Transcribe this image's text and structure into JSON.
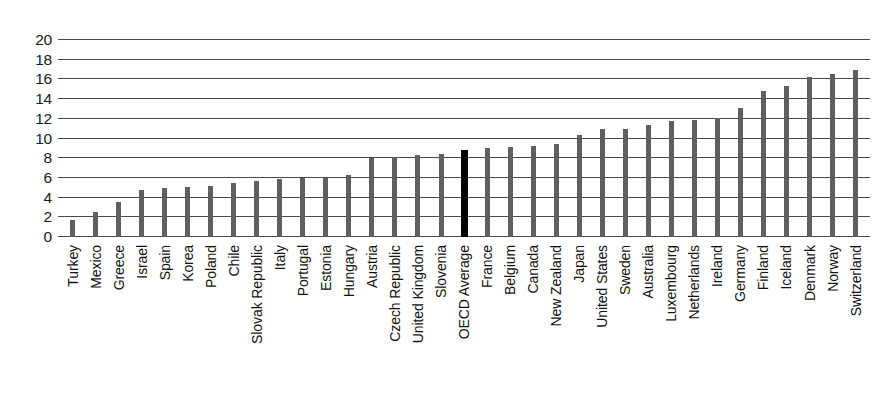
{
  "chart_data": {
    "type": "bar",
    "title": "",
    "xlabel": "",
    "ylabel": "",
    "ylim": [
      0,
      20
    ],
    "y_ticks": [
      0,
      2,
      4,
      6,
      8,
      10,
      12,
      14,
      16,
      18,
      20
    ],
    "grid": true,
    "legend": "none",
    "bar_color": "#5f5f5f",
    "highlight_color": "#000000",
    "highlight_category": "OECD Average",
    "categories": [
      "Turkey",
      "Mexico",
      "Greece",
      "Israel",
      "Spain",
      "Korea",
      "Poland",
      "Chile",
      "Slovak Republic",
      "Italy",
      "Portugal",
      "Estonia",
      "Hungary",
      "Austria",
      "Czech Republic",
      "United Kingdom",
      "Slovenia",
      "OECD Average",
      "France",
      "Belgium",
      "Canada",
      "New Zealand",
      "Japan",
      "United States",
      "Sweden",
      "Australia",
      "Luxembourg",
      "Netherlands",
      "Ireland",
      "Germany",
      "Finland",
      "Iceland",
      "Denmark",
      "Norway",
      "Switzerland"
    ],
    "values": [
      1.7,
      2.5,
      3.6,
      4.8,
      5.0,
      5.1,
      5.2,
      5.5,
      5.7,
      5.9,
      6.0,
      6.0,
      6.3,
      8.0,
      8.1,
      8.3,
      8.4,
      8.8,
      9.0,
      9.1,
      9.2,
      9.4,
      10.4,
      11.0,
      11.0,
      11.4,
      11.8,
      11.9,
      12.1,
      13.1,
      14.8,
      15.3,
      16.2,
      16.5,
      17.0
    ]
  }
}
